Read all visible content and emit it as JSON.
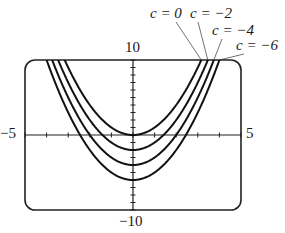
{
  "chart_data": {
    "type": "line",
    "title": "",
    "xlabel": "",
    "ylabel": "",
    "xlim": [
      -5,
      5
    ],
    "ylim": [
      -10,
      10
    ],
    "grid": false,
    "tick_labels": {
      "x_min": "−5",
      "x_max": "5",
      "y_max": "10",
      "y_min": "−10"
    },
    "x_ticks": [
      -5,
      -4,
      -3,
      -2,
      -1,
      0,
      1,
      2,
      3,
      4,
      5
    ],
    "y_ticks": [
      -10,
      -9,
      -8,
      -7,
      -6,
      -5,
      -4,
      -3,
      -2,
      -1,
      0,
      1,
      2,
      3,
      4,
      5,
      6,
      7,
      8,
      9,
      10
    ],
    "function": "y = x^2 + c",
    "series": [
      {
        "name": "c = 0",
        "c": 0
      },
      {
        "name": "c = −2",
        "c": -2
      },
      {
        "name": "c = −4",
        "c": -4
      },
      {
        "name": "c = −6",
        "c": -6
      }
    ],
    "annotations": [
      "c = 0",
      "c = −2",
      "c = −4",
      "c = −6"
    ],
    "colors": {
      "curve": "#111111",
      "frame": "#222222"
    }
  }
}
